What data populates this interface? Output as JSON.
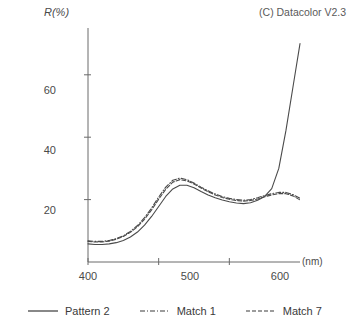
{
  "credit": "(C) Datacolor V2.3",
  "axes": {
    "y_title": "R(%)",
    "x_unit": "(nm)",
    "y_ticks": [
      "20",
      "40",
      "60"
    ],
    "x_ticks": [
      "400",
      "500",
      "600"
    ]
  },
  "legend": {
    "items": [
      {
        "label": "Pattern 2",
        "style": "solid"
      },
      {
        "label": "Match 1",
        "style": "dash-dot"
      },
      {
        "label": "Match 7",
        "style": "dashed"
      }
    ]
  },
  "chart_data": {
    "type": "line",
    "title": "",
    "subtitle": "(C) Datacolor V2.3",
    "xlabel": "(nm)",
    "ylabel": "R(%)",
    "xlim": [
      400,
      700
    ],
    "ylim": [
      0,
      75
    ],
    "xticks": [
      400,
      500,
      600
    ],
    "yticks": [
      20,
      40,
      60
    ],
    "grid": false,
    "legend_position": "below",
    "x": [
      400,
      410,
      420,
      430,
      440,
      450,
      460,
      470,
      480,
      490,
      500,
      510,
      520,
      530,
      540,
      550,
      560,
      570,
      580,
      590,
      600,
      610,
      620,
      630,
      640,
      650,
      660,
      670,
      680,
      690,
      700
    ],
    "series": [
      {
        "name": "Pattern 2",
        "style": "solid",
        "color": "#4a4a4a",
        "values": [
          5.8,
          5.6,
          5.6,
          5.8,
          6.2,
          6.9,
          8.0,
          9.6,
          11.8,
          14.6,
          17.8,
          21.0,
          23.4,
          24.6,
          24.6,
          23.8,
          22.6,
          21.5,
          20.6,
          19.9,
          19.3,
          18.9,
          18.7,
          19.0,
          19.8,
          21.0,
          23.5,
          30.0,
          42.0,
          56.0,
          70.0
        ]
      },
      {
        "name": "Match 1",
        "style": "dash-dot",
        "color": "#4a4a4a",
        "values": [
          6.8,
          6.6,
          6.6,
          6.9,
          7.5,
          8.4,
          9.8,
          11.7,
          14.2,
          17.3,
          20.8,
          24.0,
          26.2,
          26.9,
          26.4,
          25.3,
          24.0,
          22.8,
          21.8,
          21.0,
          20.4,
          20.0,
          19.8,
          20.0,
          20.6,
          21.3,
          21.9,
          22.3,
          22.3,
          21.6,
          20.4
        ]
      },
      {
        "name": "Match 7",
        "style": "dashed",
        "color": "#4a4a4a",
        "values": [
          6.6,
          6.4,
          6.4,
          6.7,
          7.3,
          8.2,
          9.5,
          11.3,
          13.7,
          16.7,
          20.1,
          23.3,
          25.6,
          26.4,
          26.0,
          25.0,
          23.7,
          22.5,
          21.5,
          20.7,
          20.1,
          19.7,
          19.5,
          19.7,
          20.2,
          20.9,
          21.5,
          21.9,
          21.9,
          21.2,
          19.9
        ]
      }
    ]
  }
}
